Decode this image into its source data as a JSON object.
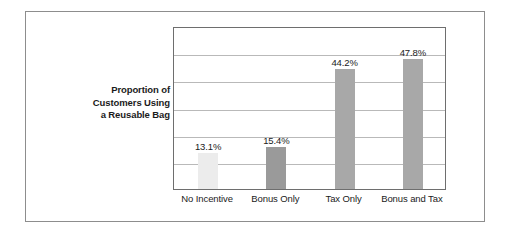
{
  "chart_data": {
    "type": "bar",
    "title": "",
    "subtitle": "",
    "xlabel": "",
    "ylabel": "Proportion of Customers Using a Reusable Bag",
    "ylabel_lines": [
      "Proportion of",
      "Customers Using",
      "a Reusable Bag"
    ],
    "categories": [
      "No Incentive",
      "Bonus Only",
      "Tax Only",
      "Bonus and Tax"
    ],
    "values": [
      13.1,
      15.4,
      44.2,
      47.8
    ],
    "data_labels": [
      "13.1%",
      "15.4%",
      "44.2%",
      "47.8%"
    ],
    "ylim": [
      0,
      60
    ],
    "grid": true,
    "gridline_count": 6,
    "legend": "none",
    "bar_colors": [
      "#ececec",
      "#9a9a9a",
      "#a8a8a8",
      "#a8a8a8"
    ],
    "plot_border_color": "#6e6e6e",
    "gridline_color": "#b9b9b9",
    "outer_border_color": "#8d8d8d",
    "background_color": "#ffffff",
    "text_color": "#1b1b1b"
  }
}
